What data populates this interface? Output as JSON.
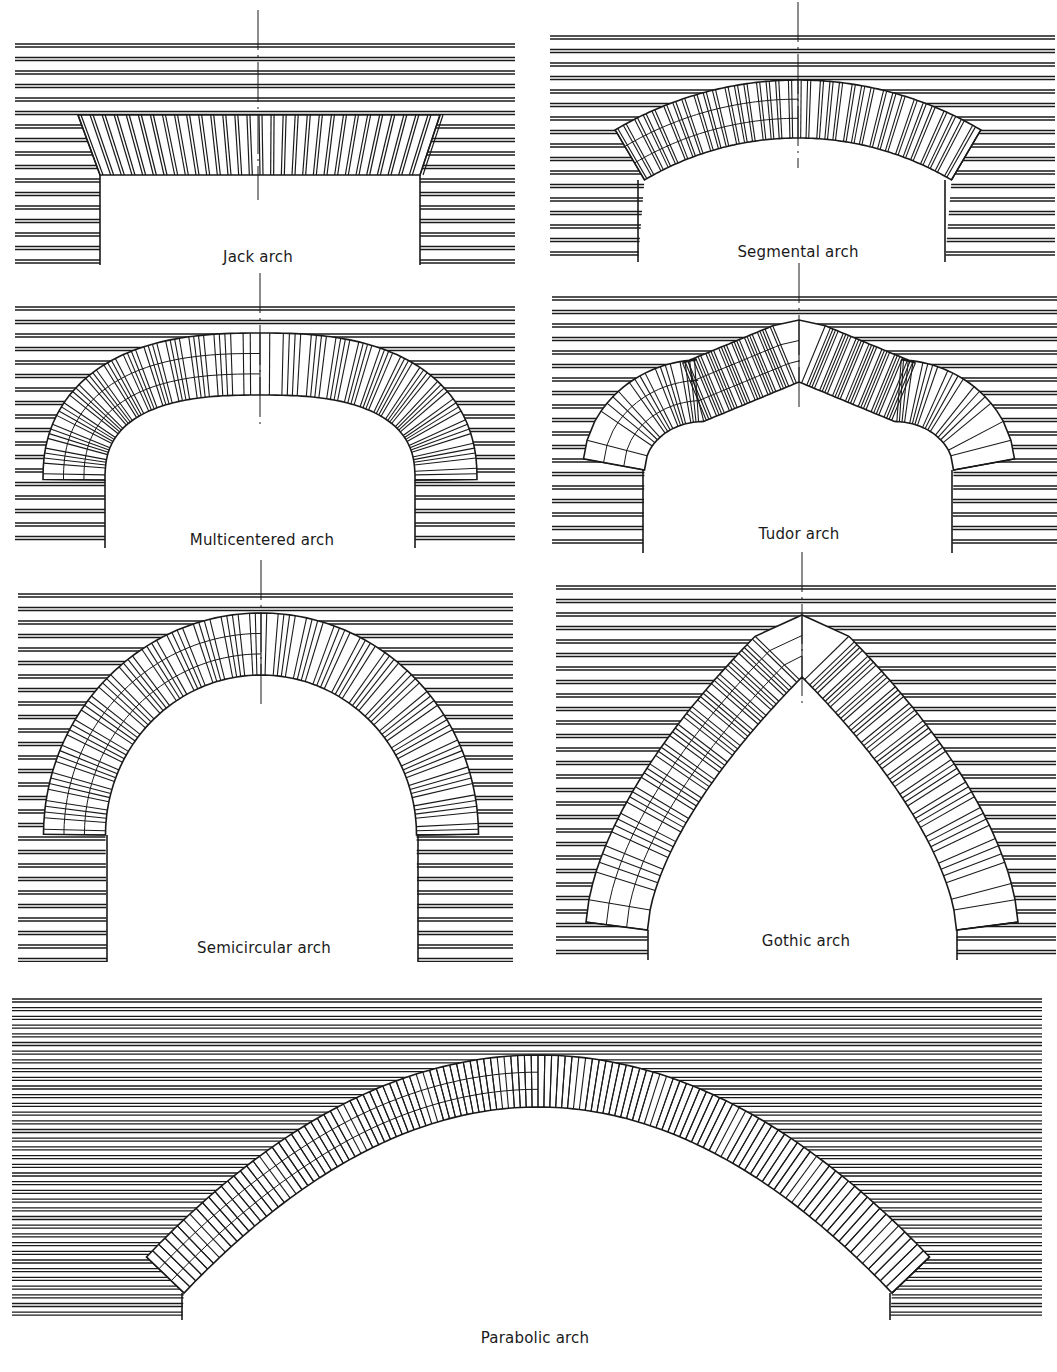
{
  "figure": {
    "ink_color": "#1a1a1a",
    "background_color": "#ffffff",
    "panels": [
      {
        "id": "jack",
        "label": "Jack arch",
        "box": [
          15,
          40,
          500,
          225
        ],
        "label_pos": [
          258,
          258
        ],
        "type": "jack",
        "center_x": 258,
        "opening": [
          100,
          420
        ],
        "spring_y": 175,
        "top_y": 115,
        "skew_left": [
          78,
          100
        ],
        "skew_right": [
          440,
          420
        ],
        "course_spacing": 13.5
      },
      {
        "id": "segmental",
        "label": "Segmental arch",
        "box": [
          550,
          32,
          505,
          230
        ],
        "label_pos": [
          798,
          253
        ],
        "type": "segmental",
        "center_x": 798,
        "opening": [
          638,
          945
        ],
        "spring_y": 180,
        "crown_y": 138,
        "thickness": 58,
        "course_spacing": 13.5
      },
      {
        "id": "multicentered",
        "label": "Multicentered arch",
        "box": [
          15,
          303,
          500,
          245
        ],
        "label_pos": [
          262,
          541
        ],
        "type": "multicentered",
        "center_x": 260,
        "opening": [
          105,
          415
        ],
        "spring_y": 480,
        "crown_y": 395,
        "thickness": 62,
        "course_spacing": 13.5
      },
      {
        "id": "tudor",
        "label": "Tudor arch",
        "box": [
          552,
          293,
          505,
          260
        ],
        "label_pos": [
          799,
          535
        ],
        "type": "tudor",
        "center_x": 799,
        "opening": [
          643,
          952
        ],
        "spring_y": 470,
        "crown_y": 382,
        "thickness": 62,
        "course_spacing": 13.5
      },
      {
        "id": "semicircular",
        "label": "Semicircular arch",
        "box": [
          18,
          590,
          495,
          372
        ],
        "label_pos": [
          264,
          949
        ],
        "type": "semicircular",
        "center_x": 261,
        "opening": [
          107,
          418
        ],
        "spring_y": 835,
        "crown_y": 675,
        "thickness": 62,
        "course_spacing": 13.5
      },
      {
        "id": "gothic",
        "label": "Gothic arch",
        "box": [
          556,
          582,
          500,
          378
        ],
        "label_pos": [
          806,
          942
        ],
        "type": "gothic",
        "center_x": 802,
        "opening": [
          648,
          957
        ],
        "spring_y": 930,
        "crown_y": 677,
        "thickness": 62,
        "course_spacing": 13.5
      },
      {
        "id": "parabolic",
        "label": "Parabolic arch",
        "box": [
          12,
          995,
          1030,
          325
        ],
        "label_pos": [
          535,
          1339
        ],
        "type": "parabolic",
        "center_x": 538,
        "opening": [
          182,
          890
        ],
        "spring_y": 1293,
        "crown_y": 1107,
        "thickness": 52,
        "course_spacing": 8.7
      }
    ]
  }
}
